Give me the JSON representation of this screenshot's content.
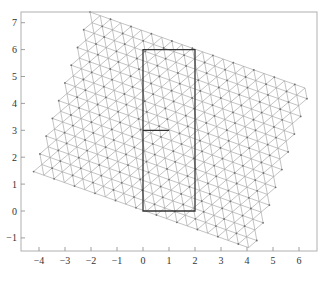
{
  "chart_data": {
    "type": "mesh-plot",
    "title": "",
    "xlabel": "",
    "ylabel": "",
    "xlim": [
      -4.6,
      6.7
    ],
    "ylim": [
      -1.5,
      7.4
    ],
    "x_ticks": [
      -4,
      -3,
      -2,
      -1,
      0,
      1,
      2,
      3,
      4,
      5,
      6
    ],
    "y_ticks": [
      -1,
      0,
      1,
      2,
      3,
      4,
      5,
      6,
      7
    ],
    "x_tick_labels": [
      "−4",
      "−3",
      "−2",
      "−1",
      "0",
      "1",
      "2",
      "3",
      "4",
      "5",
      "6"
    ],
    "y_tick_labels": [
      "−1",
      "0",
      "1",
      "2",
      "3",
      "4",
      "5",
      "6",
      "7"
    ],
    "grid": false,
    "legend": null,
    "mesh": {
      "kind": "rotated triangular lattice",
      "corners": [
        [
          -1.9,
          7.4
        ],
        [
          6.3,
          4.5
        ],
        [
          4.1,
          -1.4
        ],
        [
          -4.2,
          1.3
        ]
      ],
      "edge_length_units": 0.41,
      "color": "#9a9a9a"
    },
    "overlay_path": {
      "description": "rectangle [0,2]x[0,6] with interior segment at y=3 from x=0 to x=1",
      "points": [
        [
          1,
          3
        ],
        [
          0,
          3
        ],
        [
          0,
          6
        ],
        [
          2,
          6
        ],
        [
          2,
          0
        ],
        [
          0,
          0
        ],
        [
          0,
          3
        ]
      ],
      "color": "#333333"
    }
  }
}
